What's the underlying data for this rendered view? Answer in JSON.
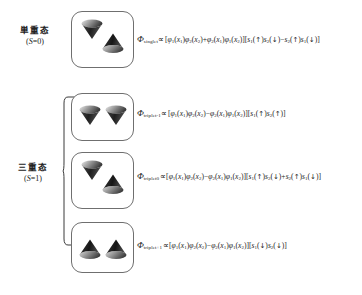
{
  "figure": {
    "caption": "",
    "rows": [
      {
        "id": "singlet",
        "group_label_cn": "単重态",
        "group_label_spin": "(S=0)",
        "box_icon": "two-cones-down-up",
        "cones": [
          "down",
          "up"
        ],
        "formula": {
          "symbol": "Φ",
          "subscript": "singlet",
          "relation": "∝",
          "spatial": "[φ1(x1)φ2(x2)+φ2(x1)φ1(x2)]",
          "spin": "[s1(↑)s2(↓)−s2(↑)s1(↓)]",
          "full": "Φsinglet ∝ [φ1(x1)φ2(x2)+φ2(x1)φ1(x2)][s1(↑)s2(↓)−s2(↑)s1(↓)]"
        }
      },
      {
        "id": "triplet-1",
        "group_label_cn": "",
        "group_label_spin": "",
        "box_icon": "two-cones-down-down",
        "cones": [
          "down",
          "down"
        ],
        "formula": {
          "symbol": "Φ",
          "subscript": "triplet-1",
          "relation": "∝",
          "spatial": "[φ1(x1)φ2(x2)−φ2(x1)φ1(x2)]",
          "spin": "[s1(↑)s2(↑)]",
          "full": "Φtriplet-1 ∝ [φ1(x1)φ2(x2)−φ2(x1)φ1(x2)][s1(↑)s2(↑)]"
        }
      },
      {
        "id": "triplet-0",
        "group_label_cn": "三重态",
        "group_label_spin": "(S=1)",
        "box_icon": "two-cones-down-up",
        "cones": [
          "down",
          "up"
        ],
        "formula": {
          "symbol": "Φ",
          "subscript": "triplet0",
          "relation": "∝",
          "spatial": "[φ1(x1)φ2(x2)−φ2(x1)φ1(x2)]",
          "spin": "[s1(↑)s2(↓)+s2(↑)s1(↓)]",
          "full": "Φtriplet0 ∝ [φ1(x1)φ2(x2)−φ2(x1)φ1(x2)][s1(↑)s2(↓)+s2(↑)s1(↓)]"
        }
      },
      {
        "id": "triplet-2",
        "group_label_cn": "",
        "group_label_spin": "",
        "box_icon": "two-cones-up-up",
        "cones": [
          "up",
          "up"
        ],
        "formula": {
          "symbol": "Φ",
          "subscript": "triplet+1",
          "relation": "∝",
          "spatial": "[φ1(x1)φ2(x2)−φ2(x1)φ1(x2)]",
          "spin": "[s1(↓)s2(↓)]",
          "full": "Φtriplet+1 ∝ [φ1(x1)φ2(x2)−φ2(x1)φ1(x2)][s1(↓)s2(↓)]"
        }
      }
    ],
    "labels": {
      "singlet_cn": "単重态",
      "singlet_spin_prefix": "(",
      "singlet_spin_var": "S",
      "singlet_spin_val": "=0)",
      "triplet_cn": "三重态",
      "triplet_spin_prefix": "(",
      "triplet_spin_var": "S",
      "triplet_spin_val": "=1)"
    },
    "tokens": {
      "phi_cap": "Φ",
      "prop": "∝",
      "bracket_open": "[",
      "bracket_close": "]",
      "phi_low": "φ",
      "s_low": "s",
      "x": "x",
      "up_arrow": "↑",
      "down_arrow": "↓",
      "plus": "+",
      "minus": "−",
      "paren_open": "(",
      "paren_close": ")",
      "sub_singlet": "singlet",
      "sub_triplet_minus": "triplet-1",
      "sub_triplet_zero": "triplet0",
      "sub_triplet_plus": "triplet+1",
      "one": "1",
      "two": "2"
    },
    "colors": {
      "box_border": "#6f6f6f",
      "cone_dark": "#2b2b2b",
      "cone_light": "#cfcfcf",
      "text": "#1e1e1e",
      "background": "#ffffff"
    }
  }
}
